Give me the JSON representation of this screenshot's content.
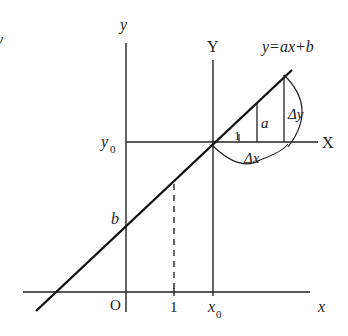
{
  "diagram": {
    "equation_label": "y=ax+b",
    "axes": {
      "original": {
        "x_label": "x",
        "y_label": "y",
        "origin_label": "O"
      },
      "shifted": {
        "x_label": "X",
        "y_label": "Y"
      }
    },
    "points": {
      "y_intercept_label": "b",
      "y0_label": "y",
      "y0_sub": "0",
      "x0_label": "x",
      "x0_sub": "0",
      "unit_tick_label": "1"
    },
    "slope_annotations": {
      "run_unit_label": "1",
      "rise_label": "a",
      "delta_y_label": "Δy",
      "delta_x_label": "Δx"
    },
    "stray_mark": "y"
  }
}
